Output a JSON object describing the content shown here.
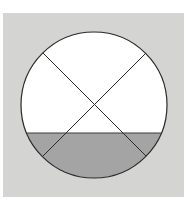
{
  "diagram": {
    "type": "circle-with-diagonals",
    "background_color": "#d4d4d2",
    "circle": {
      "cx": 94,
      "cy": 105,
      "r": 73,
      "fill": "#ffffff",
      "stroke": "#2a2a2a"
    },
    "fill_region": {
      "level_y": 133,
      "color": "#a4a4a4"
    },
    "diagonals": [
      {
        "x1": 43,
        "y1": 53,
        "x2": 146,
        "y2": 156
      },
      {
        "x1": 146,
        "y1": 53,
        "x2": 43,
        "y2": 156
      }
    ]
  }
}
